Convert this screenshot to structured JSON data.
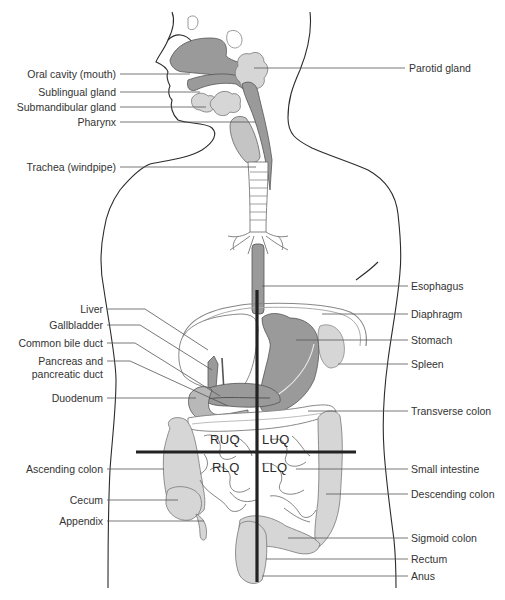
{
  "colors": {
    "organ_dark": "#9a9a9a",
    "organ_mid": "#b8b8b8",
    "organ_light": "#d6d6d6",
    "outline": "#2b2b2b",
    "leader": "#555555",
    "quadrant_line": "#222222",
    "text": "#333333"
  },
  "labels_left": [
    {
      "id": "oral-cavity",
      "text": "Oral cavity (mouth)"
    },
    {
      "id": "sublingual-gland",
      "text": "Sublingual gland"
    },
    {
      "id": "submandibular-gland",
      "text": "Submandibular gland"
    },
    {
      "id": "pharynx",
      "text": "Pharynx"
    },
    {
      "id": "trachea",
      "text": "Trachea (windpipe)"
    },
    {
      "id": "liver",
      "text": "Liver"
    },
    {
      "id": "gallbladder",
      "text": "Gallbladder"
    },
    {
      "id": "common-bile-duct",
      "text": "Common bile duct"
    },
    {
      "id": "pancreas-line1",
      "text": "Pancreas and"
    },
    {
      "id": "pancreas-line2",
      "text": "pancreatic duct"
    },
    {
      "id": "duodenum",
      "text": "Duodenum"
    },
    {
      "id": "ascending-colon",
      "text": "Ascending colon"
    },
    {
      "id": "cecum",
      "text": "Cecum"
    },
    {
      "id": "appendix",
      "text": "Appendix"
    }
  ],
  "labels_right": [
    {
      "id": "parotid-gland",
      "text": "Parotid gland"
    },
    {
      "id": "esophagus",
      "text": "Esophagus"
    },
    {
      "id": "diaphragm",
      "text": "Diaphragm"
    },
    {
      "id": "stomach",
      "text": "Stomach"
    },
    {
      "id": "spleen",
      "text": "Spleen"
    },
    {
      "id": "transverse-colon",
      "text": "Transverse colon"
    },
    {
      "id": "small-intestine",
      "text": "Small intestine"
    },
    {
      "id": "descending-colon",
      "text": "Descending colon"
    },
    {
      "id": "sigmoid-colon",
      "text": "Sigmoid colon"
    },
    {
      "id": "rectum",
      "text": "Rectum"
    },
    {
      "id": "anus",
      "text": "Anus"
    }
  ],
  "quadrants": {
    "ruq": "RUQ",
    "luq": "LUQ",
    "rlq": "RLQ",
    "llq": "LLQ"
  }
}
